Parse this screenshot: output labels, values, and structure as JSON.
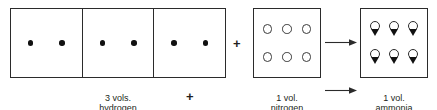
{
  "diagram": {
    "boxes": {
      "hydrogen": {
        "cells": [
          {
            "particles": [
              "filled-dot",
              "filled-dot"
            ]
          },
          {
            "particles": [
              "filled-dot",
              "filled-dot"
            ]
          },
          {
            "particles": [
              "filled-dot",
              "filled-dot"
            ]
          }
        ],
        "caption_line1": "3 vols.",
        "caption_line2": "hydrogen"
      },
      "nitrogen": {
        "particles": [
          "open-circle",
          "open-circle",
          "open-circle",
          "open-circle",
          "open-circle",
          "open-circle"
        ],
        "caption_line1": "1 vol.",
        "caption_line2": "nitrogen"
      },
      "ammonia": {
        "molecules": [
          "circle-with-wedge",
          "circle-with-wedge",
          "circle-with-wedge",
          "circle-with-wedge",
          "circle-with-wedge",
          "circle-with-wedge"
        ],
        "caption_line1": "1 vol.",
        "caption_line2": "ammonia"
      }
    },
    "operators": {
      "plus_under_hydrogen": "+",
      "plus_between_reactants": "+"
    },
    "arrows": [
      {
        "name": "reaction-arrow-upper",
        "direction": "right"
      },
      {
        "name": "reaction-arrow-lower",
        "direction": "right"
      }
    ],
    "colors": {
      "stroke": "#2b2b2b",
      "fill_particle": "#111111",
      "background": "#ffffff",
      "text": "#231f20"
    }
  }
}
